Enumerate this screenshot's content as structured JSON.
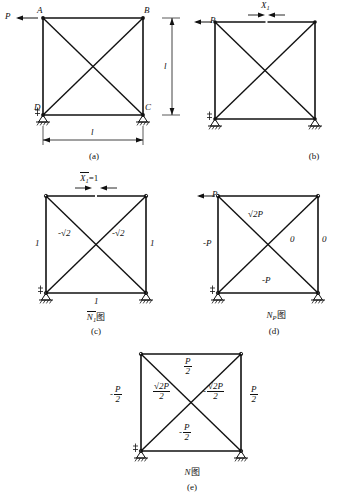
{
  "figure": {
    "type": "structural-truss-force-diagrams",
    "panels": [
      {
        "key": "a",
        "caption": "(a)",
        "nodes": [
          "A",
          "B",
          "C",
          "D"
        ],
        "load_label": "P",
        "dim_horizontal": "l",
        "dim_vertical": "l",
        "title": ""
      },
      {
        "key": "b",
        "caption": "(b)",
        "load_label": "P",
        "cut_label": "X",
        "cut_sub": "1",
        "title": ""
      },
      {
        "key": "c",
        "caption": "(c)",
        "cut_label": "X",
        "cut_sub": "1",
        "cut_value": "=1",
        "title_main": "N",
        "title_sub": "1",
        "title_suffix": "图",
        "members": {
          "left": "1",
          "right": "1",
          "bottom": "1",
          "diag_left": "-√2",
          "diag_right": "-√2"
        }
      },
      {
        "key": "d",
        "caption": "(d)",
        "load_label": "P",
        "title_main": "N",
        "title_sub": "P",
        "title_suffix": "图",
        "members": {
          "left": "-P",
          "right": "0",
          "bottom": "-P",
          "diag_left": "√2P",
          "diag_right": "0"
        }
      },
      {
        "key": "e",
        "caption": "(e)",
        "title_main": "N",
        "title_suffix": "图",
        "members": {
          "top_num": "P",
          "top_den": "2",
          "left_sign": "-",
          "left_num": "P",
          "left_den": "2",
          "right_num": "P",
          "right_den": "2",
          "bottom_sign": "-",
          "bottom_num": "P",
          "bottom_den": "2",
          "diag_left_num": "√2P",
          "diag_left_den": "2",
          "diag_right_sign": "-",
          "diag_right_num": "√2P",
          "diag_right_den": "2"
        }
      }
    ],
    "colors": {
      "line": "#111111",
      "background": "#ffffff"
    }
  }
}
